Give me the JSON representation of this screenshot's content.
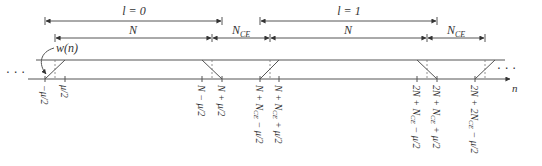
{
  "diagram": {
    "type": "ofdm-windowing-timeline",
    "colors": {
      "line": "#555555",
      "text": "#333333",
      "background": "#ffffff"
    },
    "symbol_labels": [
      {
        "text": "l = 0"
      },
      {
        "text": "l = 1"
      }
    ],
    "segments": [
      {
        "text": "N"
      },
      {
        "text": "N",
        "sub": "CE"
      },
      {
        "text": "N"
      },
      {
        "text": "N",
        "sub": "CE"
      }
    ],
    "window_label": "w(n)",
    "ellipsis_left": "· · ·",
    "ellipsis_right": "· · ·",
    "axis_label": "n",
    "ticks": [
      "−μ/2",
      "μ/2",
      "N − μ/2",
      "N + μ/2",
      "N + N_CE − μ/2",
      "N + N_CE + μ/2",
      "2N + N_CE − μ/2",
      "2N + N_CE + μ/2",
      "2N + 2N_CE − μ/2"
    ],
    "tick_parts": [
      {
        "main": "−μ/2"
      },
      {
        "main": "μ/2"
      },
      {
        "main": "N − μ/2"
      },
      {
        "main": "N + μ/2"
      },
      {
        "pre": "N + N",
        "sub": "CE",
        "post": " − μ/2"
      },
      {
        "pre": "N + N",
        "sub": "CE",
        "post": " + μ/2"
      },
      {
        "pre": "2N + N",
        "sub": "CE",
        "post": " − μ/2"
      },
      {
        "pre": "2N + N",
        "sub": "CE",
        "post": " + μ/2"
      },
      {
        "pre": "2N + 2N",
        "sub": "CE",
        "post": " − μ/2"
      }
    ]
  }
}
